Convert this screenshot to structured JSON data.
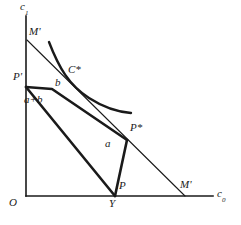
{
  "figure": {
    "type": "diagram",
    "background_color": "#ffffff",
    "ink_color": "#1a1a1a"
  },
  "axes": {
    "y_axis": {
      "label_main": "c",
      "label_sub": "1"
    },
    "x_axis": {
      "label_main": "c",
      "label_sub": "0"
    },
    "origin_label": "O",
    "origin_point": {
      "x": 26,
      "y": 196
    },
    "y_top": {
      "x": 26,
      "y": 16
    },
    "x_right": {
      "x": 213,
      "y": 196
    }
  },
  "labels": {
    "m_top": "M'",
    "m_bottom": "M'",
    "p_prime": "P'",
    "b": "b",
    "a_plus_b": "a+b",
    "c_star": "C*",
    "p_star": "P*",
    "a": "a",
    "p": "P",
    "y": "Y",
    "origin": "O"
  },
  "points": {
    "M_top": {
      "x": 27,
      "y": 40
    },
    "M_bottom": {
      "x": 185,
      "y": 196
    },
    "P_prime": {
      "x": 26,
      "y": 87
    },
    "b_end": {
      "x": 52,
      "y": 89
    },
    "kink": {
      "x": 60,
      "y": 105
    },
    "P_star": {
      "x": 127,
      "y": 140
    },
    "P": {
      "x": 115,
      "y": 196
    },
    "Y": {
      "x": 114,
      "y": 196
    },
    "C_star": {
      "x": 76,
      "y": 84
    }
  },
  "curves": {
    "indifference_curve": "M 49 42 C 60 70, 70 86, 90 99 C 104 108, 119 112, 131 113",
    "budget_line": "M 27 40 L 185 196",
    "endowment_segment_upper": "M 26 87 L 52 89 L 127 140",
    "endowment_segment_lower": "M 26 87 L 115 196",
    "triangle_side": "M 127 140 L 115 196",
    "b_bracket": "M 26 87 L 52 89"
  },
  "label_positions": {
    "c1": {
      "x": 20,
      "y": 2
    },
    "c0": {
      "x": 218,
      "y": 190
    },
    "M_top": {
      "x": 29,
      "y": 29
    },
    "M_bot": {
      "x": 181,
      "y": 182
    },
    "P_prime": {
      "x": 14,
      "y": 74
    },
    "b": {
      "x": 55,
      "y": 79
    },
    "a_plus_b": {
      "x": 25,
      "y": 96
    },
    "C_star": {
      "x": 68,
      "y": 67
    },
    "P_star": {
      "x": 131,
      "y": 125
    },
    "a": {
      "x": 106,
      "y": 140
    },
    "P": {
      "x": 120,
      "y": 182
    },
    "Y": {
      "x": 110,
      "y": 199
    },
    "O": {
      "x": 10,
      "y": 198
    }
  }
}
